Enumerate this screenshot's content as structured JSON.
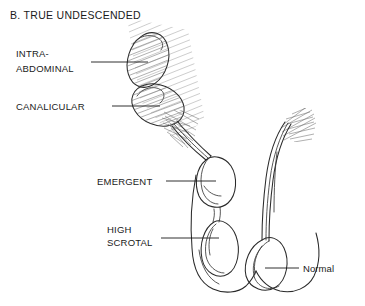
{
  "figure": {
    "title": "B.  TRUE UNDESCENDED",
    "title_letter": "B.",
    "title_text": "TRUE UNDESCENDED",
    "background_color": "#ffffff",
    "ink_color": "#1a1a1a",
    "hatch_color": "#6e6e6e",
    "type": "medical-anatomical-line-drawing"
  },
  "labels": {
    "intra_abdominal": {
      "line1": "INTRA-",
      "line2": "ABDOMINAL",
      "full": "INTRA-ABDOMINAL",
      "case": "uppercase"
    },
    "canalicular": {
      "line1": "CANALICULAR",
      "full": "CANALICULAR",
      "case": "uppercase"
    },
    "emergent": {
      "line1": "EMERGENT",
      "full": "EMERGENT",
      "case": "uppercase"
    },
    "high_scrotal": {
      "line1": "HIGH",
      "line2": "SCROTAL",
      "full": "HIGH SCROTAL",
      "case": "uppercase"
    },
    "normal": {
      "line1": "Normal",
      "full": "Normal",
      "case": "mixed"
    }
  },
  "structures": [
    {
      "name": "intra-abdominal-testis",
      "shading": "hatched",
      "position": "upper-left-oblique"
    },
    {
      "name": "canalicular-testis",
      "shading": "hatched",
      "position": "mid-oblique"
    },
    {
      "name": "emergent-testis",
      "shading": "outline",
      "position": "inguinal-exit"
    },
    {
      "name": "high-scrotal-testis",
      "shading": "outline",
      "position": "upper-scrotum"
    },
    {
      "name": "normal-testis",
      "shading": "outline",
      "position": "scrotum"
    },
    {
      "name": "spermatic-cord-left",
      "shading": "outline",
      "position": "oblique-descending"
    },
    {
      "name": "spermatic-cord-right",
      "shading": "outline",
      "position": "vertical-curved"
    },
    {
      "name": "scrotal-sac",
      "shading": "outline",
      "position": "bottom-center"
    }
  ]
}
